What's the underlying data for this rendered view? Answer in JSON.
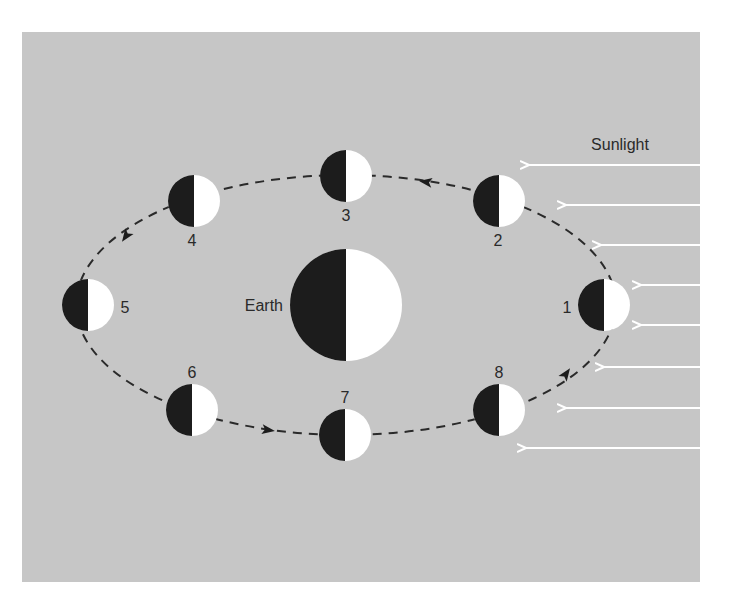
{
  "diagram": {
    "background_color": "#c6c6c6",
    "page_color": "#ffffff",
    "dark_color": "#1c1c1c",
    "light_color": "#ffffff",
    "sunlight_label": "Sunlight",
    "earth_label": "Earth",
    "earth": {
      "cx": 346,
      "cy": 305,
      "r": 56
    },
    "orbit": {
      "cx": 346,
      "cy": 305,
      "rx": 270,
      "ry": 130
    },
    "moons": [
      {
        "id": "1",
        "label": "1",
        "cx": 604,
        "cy": 305,
        "r": 26,
        "label_x": 567,
        "label_y": 313
      },
      {
        "id": "2",
        "label": "2",
        "cx": 499,
        "cy": 201,
        "r": 26,
        "label_x": 498,
        "label_y": 246
      },
      {
        "id": "3",
        "label": "3",
        "cx": 346,
        "cy": 176,
        "r": 26,
        "label_x": 346,
        "label_y": 221
      },
      {
        "id": "4",
        "label": "4",
        "cx": 194,
        "cy": 201,
        "r": 26,
        "label_x": 192,
        "label_y": 246
      },
      {
        "id": "5",
        "label": "5",
        "cx": 88,
        "cy": 305,
        "r": 26,
        "label_x": 125,
        "label_y": 313
      },
      {
        "id": "6",
        "label": "6",
        "cx": 192,
        "cy": 410,
        "r": 26,
        "label_x": 192,
        "label_y": 378
      },
      {
        "id": "7",
        "label": "7",
        "cx": 345,
        "cy": 435,
        "r": 26,
        "label_x": 345,
        "label_y": 403
      },
      {
        "id": "8",
        "label": "8",
        "cx": 499,
        "cy": 410,
        "r": 26,
        "label_x": 499,
        "label_y": 378
      }
    ],
    "sunlight_arrows": [
      {
        "y": 165,
        "x_start": 700,
        "x_end": 528
      },
      {
        "y": 205,
        "x_start": 700,
        "x_end": 565
      },
      {
        "y": 245,
        "x_start": 700,
        "x_end": 600
      },
      {
        "y": 285,
        "x_start": 700,
        "x_end": 640
      },
      {
        "y": 325,
        "x_start": 700,
        "x_end": 640
      },
      {
        "y": 367,
        "x_start": 700,
        "x_end": 603
      },
      {
        "y": 408,
        "x_start": 700,
        "x_end": 565
      },
      {
        "y": 448,
        "x_start": 700,
        "x_end": 525
      }
    ],
    "orbit_direction_arrows": [
      {
        "x": 426,
        "y": 182,
        "angle": 188
      },
      {
        "x": 126,
        "y": 236,
        "angle": 125
      },
      {
        "x": 268,
        "y": 430,
        "angle": 8
      },
      {
        "x": 566,
        "y": 374,
        "angle": -55
      }
    ]
  }
}
